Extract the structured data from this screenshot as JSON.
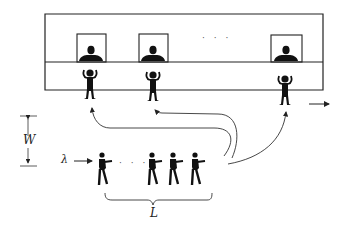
{
  "diagram": {
    "labels": {
      "width": "W",
      "arrival_rate": "λ",
      "queue_length": "L",
      "servers_ellipsis": "· · ·",
      "queue_ellipsis": "· · ·"
    },
    "servers": [
      {
        "id": "server-1"
      },
      {
        "id": "server-2"
      },
      {
        "id": "server-n"
      }
    ],
    "queue_people_count": 4,
    "colors": {
      "ink": "#111111",
      "line": "#333333",
      "background": "#ffffff"
    }
  }
}
